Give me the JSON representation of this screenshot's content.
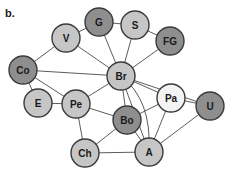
{
  "panel_label": "b.",
  "colors": {
    "light": "#c6c6c6",
    "dark": "#8e8e8e",
    "white": "#f4f4f4",
    "stroke": "#3a3a3a",
    "edge": "#4a4a4a"
  },
  "nodes": [
    {
      "id": "V",
      "label": "V",
      "x": 66,
      "y": 38,
      "tone": "light"
    },
    {
      "id": "G",
      "label": "G",
      "x": 99,
      "y": 22,
      "tone": "dark"
    },
    {
      "id": "S",
      "label": "S",
      "x": 135,
      "y": 25,
      "tone": "light"
    },
    {
      "id": "FG",
      "label": "FG",
      "x": 170,
      "y": 41,
      "tone": "dark"
    },
    {
      "id": "Co",
      "label": "Co",
      "x": 23,
      "y": 70,
      "tone": "dark"
    },
    {
      "id": "Br",
      "label": "Br",
      "x": 121,
      "y": 76,
      "tone": "light"
    },
    {
      "id": "Pa",
      "label": "Pa",
      "x": 171,
      "y": 98,
      "tone": "white"
    },
    {
      "id": "U",
      "label": "U",
      "x": 210,
      "y": 106,
      "tone": "dark"
    },
    {
      "id": "E",
      "label": "E",
      "x": 38,
      "y": 103,
      "tone": "light"
    },
    {
      "id": "Pe",
      "label": "Pe",
      "x": 76,
      "y": 104,
      "tone": "light"
    },
    {
      "id": "Bo",
      "label": "Bo",
      "x": 127,
      "y": 120,
      "tone": "dark"
    },
    {
      "id": "Ch",
      "label": "Ch",
      "x": 85,
      "y": 153,
      "tone": "light"
    },
    {
      "id": "A",
      "label": "A",
      "x": 149,
      "y": 152,
      "tone": "light"
    }
  ],
  "edges": [
    [
      "V",
      "G"
    ],
    [
      "G",
      "S"
    ],
    [
      "S",
      "FG"
    ],
    [
      "V",
      "Co"
    ],
    [
      "V",
      "Br"
    ],
    [
      "G",
      "Br"
    ],
    [
      "S",
      "Br"
    ],
    [
      "FG",
      "Br"
    ],
    [
      "Co",
      "Br"
    ],
    [
      "Co",
      "E"
    ],
    [
      "Co",
      "Pe"
    ],
    [
      "E",
      "Pe"
    ],
    [
      "Pe",
      "Br"
    ],
    [
      "Pe",
      "Bo"
    ],
    [
      "Pe",
      "Ch"
    ],
    [
      "Br",
      "Bo"
    ],
    [
      "Br",
      "Pa"
    ],
    [
      "Br",
      "A"
    ],
    [
      "Br",
      "U"
    ],
    [
      "Pa",
      "Bo"
    ],
    [
      "Pa",
      "A"
    ],
    [
      "Pa",
      "U"
    ],
    [
      "Bo",
      "Ch"
    ],
    [
      "Bo",
      "A"
    ],
    [
      "Ch",
      "A"
    ],
    [
      "A",
      "U"
    ]
  ],
  "curved_edges": [
    {
      "from": "Br",
      "to": "A",
      "cx": 152,
      "cy": 100
    }
  ],
  "node_radius": 14
}
